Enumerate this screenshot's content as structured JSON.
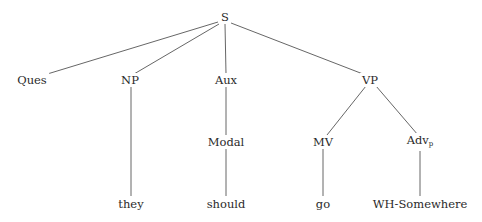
{
  "diagram": {
    "type": "syntax-tree",
    "nodes": {
      "S": {
        "label": "S",
        "x": 225,
        "y": 17
      },
      "Ques": {
        "label": "Ques",
        "x": 32,
        "y": 80
      },
      "NP": {
        "label": "NP",
        "x": 130,
        "y": 80
      },
      "Aux": {
        "label": "Aux",
        "x": 226,
        "y": 80
      },
      "VP": {
        "label": "VP",
        "x": 370,
        "y": 80
      },
      "Modal": {
        "label": "Modal",
        "x": 226,
        "y": 142
      },
      "MV": {
        "label": "MV",
        "x": 323,
        "y": 142
      },
      "Advp": {
        "label": "Adv",
        "sub": "p",
        "x": 420,
        "y": 142
      },
      "they": {
        "label": "they",
        "x": 131,
        "y": 204
      },
      "should": {
        "label": "should",
        "x": 226,
        "y": 204
      },
      "go": {
        "label": "go",
        "x": 323,
        "y": 204
      },
      "WHSomewhere": {
        "label": "WH-Somewhere",
        "x": 420,
        "y": 204
      }
    },
    "edges": [
      [
        "S",
        "Ques"
      ],
      [
        "S",
        "NP"
      ],
      [
        "S",
        "Aux"
      ],
      [
        "S",
        "VP"
      ],
      [
        "NP",
        "they"
      ],
      [
        "Aux",
        "Modal"
      ],
      [
        "Modal",
        "should"
      ],
      [
        "VP",
        "MV"
      ],
      [
        "VP",
        "Advp"
      ],
      [
        "MV",
        "go"
      ],
      [
        "Advp",
        "WHSomewhere"
      ]
    ]
  }
}
